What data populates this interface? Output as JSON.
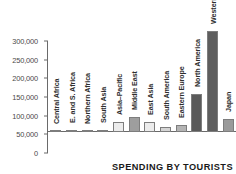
{
  "chart_data": {
    "type": "bar",
    "title": "",
    "caption": "SPENDING BY TOURISTS",
    "xlabel": "",
    "ylabel": "",
    "ylim": [
      0,
      300000
    ],
    "grid": false,
    "legend": "none",
    "ytick_labels": [
      "300,000",
      "250,000",
      "200,000",
      "150,000",
      "100,000",
      "50,000",
      "0"
    ],
    "ytick_values": [
      300000,
      250000,
      200000,
      150000,
      100000,
      50000,
      0
    ],
    "categories": [
      "Central Africa",
      "E. and S. Africa",
      "Northern Africa",
      "South Asia",
      "Asia–Pacific",
      "Middle East",
      "East Asia",
      "South America",
      "Eastern Europe",
      "North America",
      "Western Europe",
      "Japan"
    ],
    "values": [
      1500,
      5000,
      4000,
      5500,
      27000,
      39000,
      27000,
      14000,
      20000,
      103000,
      270000,
      34000
    ],
    "bar_colors": [
      "#e8e8e8",
      "#dcdcdc",
      "#d2d2d2",
      "#d8d8d8",
      "#ececec",
      "#9e9e9e",
      "#ececec",
      "#d5d5d5",
      "#b4b4b4",
      "#5a5a5a",
      "#5e5e5e",
      "#9a9a9a"
    ]
  },
  "colors": {
    "axis": "#6a6a6a",
    "text": "#2e2e2e",
    "background": "#ffffff"
  }
}
